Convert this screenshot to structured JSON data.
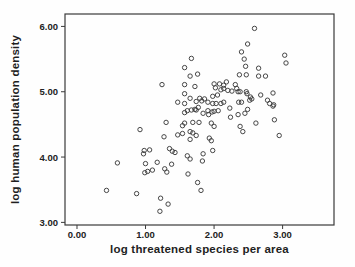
{
  "figure": {
    "background": "#fefefe",
    "frame_color": "#3a3a3a",
    "point_color": "#3d3d3d",
    "text_color": "#1f1f1f"
  },
  "chart_data": {
    "type": "scatter",
    "title": "",
    "xlabel": "log threatened species per area",
    "ylabel": "log human population density",
    "xlim": [
      -0.175,
      3.75
    ],
    "ylim": [
      2.96,
      6.19
    ],
    "xticks": [
      0,
      1,
      2,
      3
    ],
    "xtick_labels": [
      "0.00",
      "1.00",
      "2.00",
      "3.00"
    ],
    "yticks": [
      3,
      4,
      5,
      6
    ],
    "ytick_labels": [
      "3.00",
      "4.00",
      "5.00",
      "6.00"
    ],
    "grid": false,
    "legend": null,
    "marker": "open-circle",
    "points": [
      [
        1.67,
        5.51
      ],
      [
        1.57,
        5.37
      ],
      [
        1.65,
        5.24
      ],
      [
        1.76,
        5.27
      ],
      [
        1.24,
        5.11
      ],
      [
        1.57,
        5.11
      ],
      [
        1.72,
        5.08
      ],
      [
        1.57,
        4.97
      ],
      [
        1.65,
        4.9
      ],
      [
        1.47,
        4.84
      ],
      [
        1.57,
        4.82
      ],
      [
        1.74,
        4.85
      ],
      [
        1.61,
        4.71
      ],
      [
        1.67,
        4.72
      ],
      [
        1.57,
        4.68
      ],
      [
        1.74,
        4.72
      ],
      [
        2.59,
        5.97
      ],
      [
        2.49,
        5.73
      ],
      [
        2.4,
        5.61
      ],
      [
        2.44,
        5.5
      ],
      [
        2.46,
        5.39
      ],
      [
        2.65,
        5.36
      ],
      [
        3.03,
        5.56
      ],
      [
        3.05,
        5.44
      ],
      [
        2.37,
        5.26
      ],
      [
        2.47,
        5.26
      ],
      [
        2.65,
        5.24
      ],
      [
        2.75,
        5.24
      ],
      [
        2.0,
        5.12
      ],
      [
        2.08,
        5.12
      ],
      [
        2.18,
        5.15
      ],
      [
        2.14,
        5.1
      ],
      [
        2.31,
        5.11
      ],
      [
        2.33,
        5.05
      ],
      [
        2.02,
        5.06
      ],
      [
        2.1,
        5.03
      ],
      [
        2.14,
        5.05
      ],
      [
        2.2,
        5.02
      ],
      [
        2.26,
        5.01
      ],
      [
        2.35,
        5.0
      ],
      [
        2.38,
        5.0
      ],
      [
        2.47,
        5.0
      ],
      [
        1.98,
        4.93
      ],
      [
        2.05,
        4.95
      ],
      [
        1.79,
        4.9
      ],
      [
        1.82,
        4.86
      ],
      [
        1.86,
        4.89
      ],
      [
        1.91,
        4.84
      ],
      [
        1.98,
        4.82
      ],
      [
        2.03,
        4.82
      ],
      [
        2.1,
        4.82
      ],
      [
        2.14,
        4.84
      ],
      [
        1.77,
        4.76
      ],
      [
        1.72,
        4.73
      ],
      [
        2.23,
        4.75
      ],
      [
        2.36,
        4.84
      ],
      [
        2.4,
        4.84
      ],
      [
        1.91,
        4.71
      ],
      [
        2.0,
        4.7
      ],
      [
        2.06,
        4.71
      ],
      [
        1.97,
        4.69
      ],
      [
        1.84,
        4.67
      ],
      [
        1.92,
        4.65
      ],
      [
        2.24,
        4.61
      ],
      [
        2.35,
        4.65
      ],
      [
        2.45,
        4.67
      ],
      [
        2.49,
        4.73
      ],
      [
        2.48,
        4.97
      ],
      [
        2.53,
        4.92
      ],
      [
        2.55,
        4.89
      ],
      [
        2.52,
        4.87
      ],
      [
        2.68,
        4.95
      ],
      [
        2.86,
        4.98
      ],
      [
        2.78,
        4.87
      ],
      [
        2.81,
        4.82
      ],
      [
        2.87,
        4.8
      ],
      [
        2.86,
        4.78
      ],
      [
        2.88,
        4.57
      ],
      [
        2.61,
        4.52
      ],
      [
        2.95,
        4.33
      ],
      [
        1.3,
        4.53
      ],
      [
        1.57,
        4.52
      ],
      [
        1.54,
        4.48
      ],
      [
        1.69,
        4.53
      ],
      [
        1.78,
        4.53
      ],
      [
        1.96,
        4.52
      ],
      [
        2.0,
        4.47
      ],
      [
        2.38,
        4.47
      ],
      [
        2.42,
        4.39
      ],
      [
        1.47,
        4.34
      ],
      [
        1.54,
        4.36
      ],
      [
        1.65,
        4.39
      ],
      [
        1.69,
        4.37
      ],
      [
        1.74,
        4.33
      ],
      [
        1.65,
        4.27
      ],
      [
        1.27,
        4.31
      ],
      [
        1.93,
        4.29
      ],
      [
        1.96,
        4.25
      ],
      [
        0.92,
        4.42
      ],
      [
        1.35,
        4.13
      ],
      [
        1.39,
        4.09
      ],
      [
        1.43,
        4.07
      ],
      [
        1.98,
        4.1
      ],
      [
        1.84,
        4.05
      ],
      [
        0.98,
        4.1
      ],
      [
        1.06,
        4.11
      ],
      [
        0.97,
        4.05
      ],
      [
        1.61,
        4.02
      ],
      [
        1.65,
        3.97
      ],
      [
        1.83,
        3.94
      ],
      [
        0.59,
        3.91
      ],
      [
        1.0,
        3.9
      ],
      [
        1.17,
        3.92
      ],
      [
        1.38,
        3.89
      ],
      [
        1.03,
        3.78
      ],
      [
        1.1,
        3.8
      ],
      [
        0.99,
        3.76
      ],
      [
        1.28,
        3.82
      ],
      [
        1.31,
        3.77
      ],
      [
        1.62,
        3.74
      ],
      [
        1.76,
        3.61
      ],
      [
        1.81,
        3.49
      ],
      [
        0.43,
        3.49
      ],
      [
        0.87,
        3.44
      ],
      [
        1.22,
        3.37
      ],
      [
        1.33,
        3.28
      ],
      [
        1.21,
        3.17
      ]
    ]
  }
}
